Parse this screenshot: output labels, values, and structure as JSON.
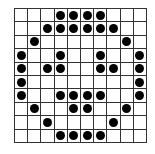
{
  "grid": {
    "rows": 10,
    "cols": 10,
    "line_color": "#333333",
    "dot_color": "#000000",
    "cells": [
      [
        0,
        0,
        0,
        1,
        1,
        1,
        1,
        0,
        0,
        0
      ],
      [
        0,
        0,
        1,
        1,
        1,
        1,
        1,
        1,
        0,
        0
      ],
      [
        0,
        1,
        0,
        0,
        0,
        0,
        0,
        0,
        1,
        0
      ],
      [
        1,
        0,
        0,
        1,
        0,
        0,
        1,
        0,
        0,
        1
      ],
      [
        1,
        0,
        1,
        1,
        0,
        0,
        1,
        1,
        0,
        1
      ],
      [
        1,
        0,
        0,
        0,
        0,
        0,
        0,
        0,
        0,
        1
      ],
      [
        1,
        0,
        0,
        1,
        1,
        1,
        1,
        0,
        0,
        1
      ],
      [
        0,
        1,
        0,
        0,
        1,
        1,
        0,
        0,
        1,
        0
      ],
      [
        0,
        0,
        1,
        0,
        0,
        0,
        0,
        1,
        0,
        0
      ],
      [
        0,
        0,
        0,
        1,
        1,
        1,
        1,
        0,
        0,
        0
      ]
    ]
  }
}
